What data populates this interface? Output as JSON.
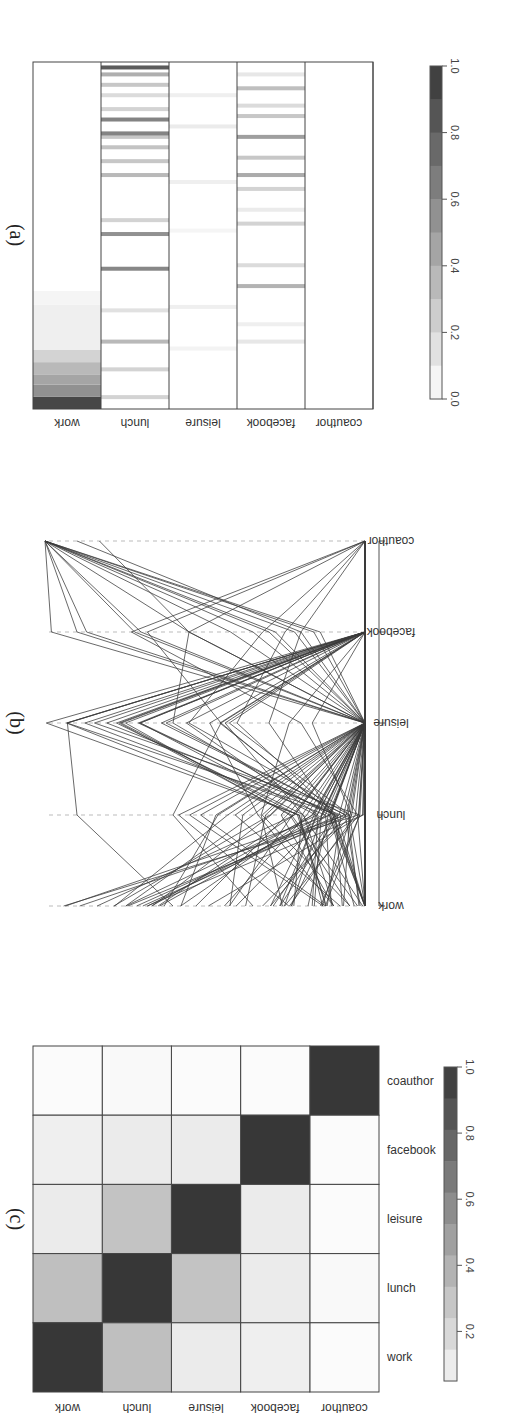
{
  "figure": {
    "rotation_deg": 90,
    "panels": [
      {
        "id": "a",
        "caption": "(a)"
      },
      {
        "id": "b",
        "caption": "(b)"
      },
      {
        "id": "c",
        "caption": "(c)"
      }
    ]
  },
  "chart_data": [
    {
      "panel": "(a)",
      "type": "heatmap",
      "title": "",
      "rows": [
        "coauthor",
        "facebook",
        "leisure",
        "lunch",
        "work"
      ],
      "description": "Per-entity membership weights across 5 layers; each column is an entity, sorted by work weight (descending).",
      "colorbar": {
        "ticks": [
          "1.0",
          "0.8",
          "0.6",
          "0.4",
          "0.2",
          "0.0"
        ],
        "range": [
          0,
          1
        ],
        "colormap": "white-to-dark-gray"
      },
      "stripes": {
        "coauthor": [],
        "facebook": [
          [
            0.2,
            0.12
          ],
          [
            0.25,
            0.08
          ],
          [
            0.36,
            0.38
          ],
          [
            0.42,
            0.18
          ],
          [
            0.54,
            0.22
          ],
          [
            0.58,
            0.1
          ],
          [
            0.64,
            0.22
          ],
          [
            0.68,
            0.42
          ],
          [
            0.73,
            0.28
          ],
          [
            0.79,
            0.48
          ],
          [
            0.85,
            0.28
          ],
          [
            0.88,
            0.18
          ],
          [
            0.93,
            0.32
          ],
          [
            0.97,
            0.12
          ]
        ],
        "leisure": [
          [
            0.18,
            0.06
          ],
          [
            0.3,
            0.08
          ],
          [
            0.52,
            0.05
          ],
          [
            0.66,
            0.08
          ],
          [
            0.82,
            0.1
          ],
          [
            0.91,
            0.08
          ]
        ],
        "lunch": [
          [
            0.04,
            0.22
          ],
          [
            0.12,
            0.22
          ],
          [
            0.2,
            0.35
          ],
          [
            0.29,
            0.15
          ],
          [
            0.41,
            0.6
          ],
          [
            0.51,
            0.55
          ],
          [
            0.55,
            0.22
          ],
          [
            0.68,
            0.35
          ],
          [
            0.72,
            0.28
          ],
          [
            0.76,
            0.3
          ],
          [
            0.79,
            0.28
          ],
          [
            0.8,
            0.62
          ],
          [
            0.84,
            0.62
          ],
          [
            0.87,
            0.22
          ],
          [
            0.91,
            0.18
          ],
          [
            0.94,
            0.28
          ],
          [
            0.97,
            0.4
          ],
          [
            0.99,
            0.82
          ]
        ],
        "work": [
          [
            0.0,
            0.92
          ],
          [
            0.035,
            0.55
          ],
          [
            0.07,
            0.45
          ],
          [
            0.1,
            0.35
          ],
          [
            0.135,
            0.22
          ],
          [
            0.17,
            0.08
          ],
          [
            0.3,
            0.05
          ]
        ]
      }
    },
    {
      "panel": "(b)",
      "type": "line",
      "subtype": "parallel-coordinates",
      "title": "",
      "categories": [
        "coauthor",
        "facebook",
        "leisure",
        "lunch",
        "work"
      ],
      "ylim": [
        0,
        1
      ],
      "grid": "dashed vertical guides at each axis",
      "description": "Each polyline is one entity's weights across layers; ~80 lines."
    },
    {
      "panel": "(c)",
      "type": "heatmap",
      "title": "",
      "rows": [
        "coauthor",
        "facebook",
        "leisure",
        "lunch",
        "work"
      ],
      "columns": [
        "coauthor",
        "facebook",
        "leisure",
        "lunch",
        "work"
      ],
      "values": [
        [
          1.0,
          0.02,
          0.02,
          0.03,
          0.02
        ],
        [
          0.02,
          1.0,
          0.1,
          0.1,
          0.08
        ],
        [
          0.02,
          0.1,
          1.0,
          0.3,
          0.1
        ],
        [
          0.03,
          0.1,
          0.3,
          1.0,
          0.32
        ],
        [
          0.02,
          0.08,
          0.1,
          0.32,
          1.0
        ]
      ],
      "colorbar": {
        "ticks": [
          "1.0",
          "0.8",
          "0.6",
          "0.4",
          "0.2"
        ],
        "range": [
          0.05,
          1
        ],
        "colormap": "white-to-dark-gray"
      }
    }
  ]
}
